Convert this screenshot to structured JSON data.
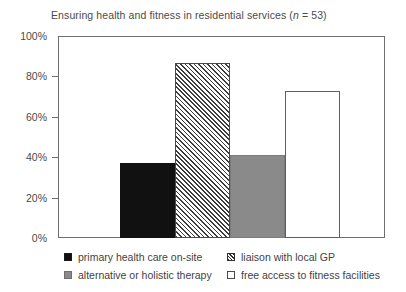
{
  "chart_data": {
    "type": "bar",
    "title": "Ensuring health and fitness in residential services (n = 53)",
    "title_prefix": "Ensuring health and fitness in residential services (",
    "title_italic": "n",
    "title_suffix": " = 53)",
    "sample_size_label": "n = 53",
    "xlabel": "",
    "ylabel": "",
    "ylim": [
      0,
      100
    ],
    "y_tick_labels": [
      "100%",
      "80%",
      "60%",
      "40%",
      "20%",
      "0%"
    ],
    "y_tick_values": [
      100,
      80,
      60,
      40,
      20,
      0
    ],
    "grid": false,
    "legend_position": "bottom",
    "categories": [
      "primary health care on-site",
      "liaison with local GP",
      "alternative or holistic therapy",
      "free access to fitness facilities"
    ],
    "values": [
      37,
      86.5,
      41,
      73
    ],
    "series": [
      {
        "name": "Ensuring health and fitness in residential services",
        "values": [
          37,
          86.5,
          41,
          73
        ]
      }
    ],
    "bars": [
      {
        "label": "primary health care on-site",
        "value": 37,
        "fill": "solid-black",
        "color": "#111111"
      },
      {
        "label": "liaison with local GP",
        "value": 86.5,
        "fill": "hatched",
        "color": "#ffffff"
      },
      {
        "label": "alternative or holistic therapy",
        "value": 41,
        "fill": "solid-gray",
        "color": "#8a8a8a"
      },
      {
        "label": "free access to fitness facilities",
        "value": 73,
        "fill": "open",
        "color": "#ffffff"
      }
    ]
  },
  "legend": {
    "column_left": [
      {
        "label": "primary health care on-site",
        "swatch": "solid-black"
      },
      {
        "label": "alternative or holistic therapy",
        "swatch": "solid-gray"
      }
    ],
    "column_right": [
      {
        "label": "liaison with local GP",
        "swatch": "hatched"
      },
      {
        "label": "free access to fitness facilities",
        "swatch": "open"
      }
    ]
  },
  "colors": {
    "black_bar": "#111111",
    "gray_bar": "#8a8a8a",
    "open_bar": "#ffffff",
    "frame": "#6e6e6e",
    "text": "#3f3f3f",
    "background": "#ffffff"
  }
}
